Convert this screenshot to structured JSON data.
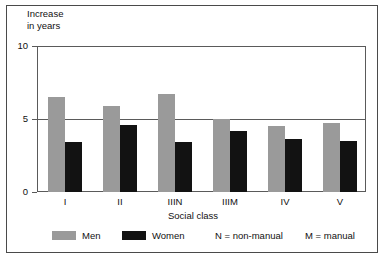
{
  "chart_data": {
    "type": "bar",
    "title": "",
    "subtitle": "",
    "ylabel": "Increase\nin years",
    "xlabel": "Social class",
    "categories": [
      "I",
      "II",
      "IIIN",
      "IIIM",
      "IV",
      "V"
    ],
    "series": [
      {
        "name": "Men",
        "color": "#9a9a9a",
        "values": [
          6.5,
          5.9,
          6.7,
          5.0,
          4.5,
          4.7
        ]
      },
      {
        "name": "Women",
        "color": "#121212",
        "values": [
          3.4,
          4.6,
          3.4,
          4.2,
          3.6,
          3.5
        ]
      }
    ],
    "ylim": [
      0,
      10
    ],
    "yticks": [
      0,
      5,
      10
    ],
    "ytick_labels": [
      "0",
      "5",
      "10"
    ],
    "grid": true,
    "gridlines_at": [
      5
    ],
    "legend_position": "bottom-left",
    "annotations": [
      "N = non-manual",
      "M = manual"
    ]
  },
  "figure": {
    "y_caption": "Increase\nin years",
    "x_title": "Social class",
    "ytick_labels": [
      "10",
      "5",
      "0"
    ],
    "xtick_labels": [
      "I",
      "II",
      "IIIN",
      "IIIM",
      "IV",
      "V"
    ],
    "legend": {
      "men_label": "Men",
      "women_label": "Women",
      "note_non_manual": "N = non-manual",
      "note_manual": "M = manual"
    }
  }
}
